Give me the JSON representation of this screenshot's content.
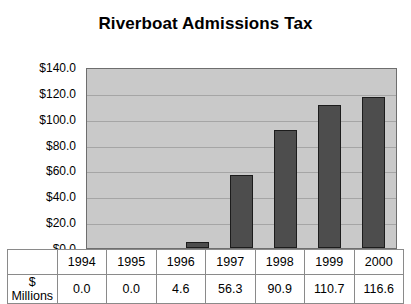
{
  "chart_data": {
    "type": "bar",
    "title": "Riverboat Admissions Tax",
    "xlabel": "",
    "ylabel": "",
    "categories": [
      "1994",
      "1995",
      "1996",
      "1997",
      "1998",
      "1999",
      "2000"
    ],
    "values": [
      0.0,
      0.0,
      4.6,
      56.3,
      90.9,
      110.7,
      116.6
    ],
    "series": [
      {
        "name": "$ Millions",
        "values": [
          0.0,
          0.0,
          4.6,
          56.3,
          90.9,
          110.7,
          116.6
        ]
      }
    ],
    "ylim": [
      0,
      140
    ],
    "ytick_values": [
      140,
      120,
      100,
      80,
      60,
      40,
      20,
      0
    ],
    "ytick_labels": [
      "$140.0",
      "$120.0",
      "$100.0",
      "$80.0",
      "$60.0",
      "$40.0",
      "$20.0",
      "$0.0"
    ],
    "grid": true,
    "legend": false,
    "legend_position": "none",
    "bar_color": "#4d4d4d",
    "plot_background": "#c9c9c9",
    "gridline_color": "#a5a5a5"
  },
  "table": {
    "row_header": "$ Millions",
    "columns": [
      "1994",
      "1995",
      "1996",
      "1997",
      "1998",
      "1999",
      "2000"
    ],
    "values": [
      "0.0",
      "0.0",
      "4.6",
      "56.3",
      "90.9",
      "110.7",
      "116.6"
    ]
  }
}
